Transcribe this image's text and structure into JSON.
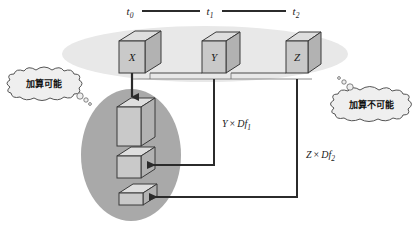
{
  "diagram": {
    "timeline": {
      "labels": [
        {
          "base": "t",
          "sub": "0"
        },
        {
          "base": "t",
          "sub": "1"
        },
        {
          "base": "t",
          "sub": "2"
        }
      ]
    },
    "top_cubes": [
      {
        "label": "X"
      },
      {
        "label": "Y"
      },
      {
        "label": "Z"
      }
    ],
    "stack_cubes": [
      {
        "label": ""
      },
      {
        "label": ""
      },
      {
        "label": ""
      }
    ],
    "bubbles": [
      {
        "name": "addable",
        "text": "加算可能"
      },
      {
        "name": "not-addable",
        "text": "加算不可能"
      }
    ],
    "formulas": [
      {
        "lhs": "Y",
        "op": "×",
        "rhs": "Df",
        "sub": "1"
      },
      {
        "lhs": "Z",
        "op": "×",
        "rhs": "Df",
        "sub": "2"
      }
    ],
    "colors": {
      "top_ellipse": "#e6e6e6",
      "bottom_ellipse": "#a8a8a8",
      "cube_front": "#c9c9c9",
      "cube_top": "#dcdcdc",
      "cube_side": "#b4b4b4",
      "outline": "#3a3a3a",
      "arrow": "#2b2b2b",
      "bubble_fill": "#f0f0f0",
      "background": "#ffffff"
    }
  }
}
